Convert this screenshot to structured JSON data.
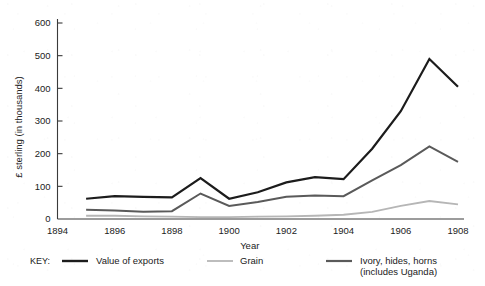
{
  "chart_data": {
    "type": "line",
    "title": "",
    "xlabel": "Year",
    "ylabel": "£ sterling (in thousands)",
    "x": [
      1895,
      1896,
      1897,
      1898,
      1899,
      1900,
      1901,
      1902,
      1903,
      1904,
      1905,
      1906,
      1907,
      1908
    ],
    "xlim": [
      1894,
      1908
    ],
    "ylim": [
      0,
      600
    ],
    "xticks": [
      1894,
      1896,
      1898,
      1900,
      1902,
      1904,
      1906,
      1908
    ],
    "xtick_labels": [
      "1894",
      "1896",
      "1898",
      "1900",
      "1902",
      "1904",
      "1906",
      "1908"
    ],
    "yticks": [
      0,
      100,
      200,
      300,
      400,
      500,
      600
    ],
    "ytick_labels": [
      "0",
      "100",
      "200",
      "300",
      "400",
      "500",
      "600"
    ],
    "grid": false,
    "legend_position": "below",
    "legend_prefix": "KEY:",
    "series": [
      {
        "name": "Value of exports",
        "color": "#1c1c1c",
        "width": 2.2,
        "values": [
          62,
          70,
          68,
          66,
          125,
          62,
          82,
          112,
          128,
          122,
          215,
          330,
          490,
          405
        ]
      },
      {
        "name": "Grain",
        "color": "#b6b6b6",
        "width": 1.8,
        "values": [
          10,
          10,
          8,
          7,
          6,
          6,
          7,
          8,
          10,
          13,
          22,
          40,
          55,
          45
        ]
      },
      {
        "name": "Ivory, hides, horns (includes Uganda)",
        "color": "#5a5a5a",
        "width": 2.0,
        "values": [
          28,
          26,
          22,
          24,
          78,
          40,
          52,
          68,
          72,
          70,
          118,
          165,
          222,
          175
        ]
      }
    ]
  },
  "legend": {
    "prefix": "KEY:",
    "entries": [
      {
        "label": "Value of exports",
        "color": "#1c1c1c"
      },
      {
        "label": "Grain",
        "color": "#b6b6b6"
      },
      {
        "label": "Ivory, hides, horns",
        "label2": "(includes Uganda)",
        "color": "#5a5a5a"
      }
    ]
  }
}
